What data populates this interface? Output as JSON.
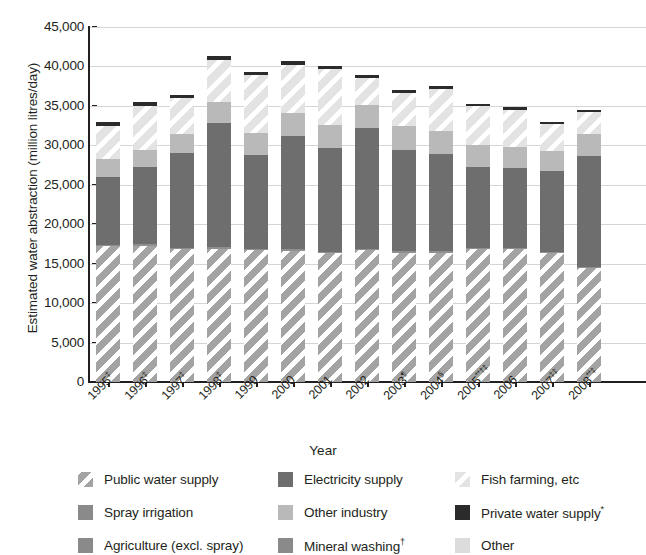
{
  "chart": {
    "type": "bar",
    "ylabel": "Estimated water abstraction (million litres/day)",
    "xlabel": "Year"
  },
  "y_axis": {
    "ticks": [
      "45,000",
      "40,000",
      "35,000",
      "30,000",
      "25,000",
      "20,000",
      "15,000",
      "10,000",
      "5,000",
      "0"
    ]
  },
  "x_axis": {
    "labels": [
      {
        "year": "1995",
        "note": "‡"
      },
      {
        "year": "1996",
        "note": "‡"
      },
      {
        "year": "1997",
        "note": "‡"
      },
      {
        "year": "1998",
        "note": "‡"
      },
      {
        "year": "1999",
        "note": ""
      },
      {
        "year": "2000",
        "note": ""
      },
      {
        "year": "2001",
        "note": ""
      },
      {
        "year": "2002",
        "note": ""
      },
      {
        "year": "2003",
        "note": "¶"
      },
      {
        "year": "2004",
        "note": "§"
      },
      {
        "year": "2005",
        "note": "**†‡"
      },
      {
        "year": "2006",
        "note": ""
      },
      {
        "year": "2007",
        "note": "‡‡"
      },
      {
        "year": "2008",
        "note": "**‡"
      }
    ]
  },
  "legend": {
    "items": [
      {
        "label": "Public water supply",
        "key": "public",
        "swatch": "hatch-medium"
      },
      {
        "label": "Spray irrigation",
        "key": "spray",
        "swatch": "solid-medium"
      },
      {
        "label": "Agriculture (excl. spray)",
        "key": "agri",
        "swatch": "solid-medium"
      },
      {
        "label": "Electricity supply",
        "key": "elec",
        "swatch": "solid-dark"
      },
      {
        "label": "Other industry",
        "key": "otherind",
        "swatch": "solid-light"
      },
      {
        "label": "Mineral washing",
        "note": "†",
        "key": "mineral",
        "swatch": "solid-medium"
      },
      {
        "label": "Fish farming, etc",
        "key": "fish",
        "swatch": "hatch-light"
      },
      {
        "label": "Private water supply",
        "note": "*",
        "key": "private",
        "swatch": "solid-black"
      },
      {
        "label": "Other",
        "key": "other",
        "swatch": "solid-verylight"
      }
    ]
  },
  "chart_data": {
    "type": "bar",
    "subtype": "stacked-vertical",
    "title": "",
    "xlabel": "Year",
    "ylabel": "Estimated water abstraction (million litres/day)",
    "ylim": [
      0,
      45000
    ],
    "ytick_step": 5000,
    "grid": true,
    "legend_position": "bottom",
    "categories": [
      "1995",
      "1996",
      "1997",
      "1998",
      "1999",
      "2000",
      "2001",
      "2002",
      "2003",
      "2004",
      "2005",
      "2006",
      "2007",
      "2008"
    ],
    "series": [
      {
        "name": "Public water supply",
        "values": [
          17200,
          17300,
          16800,
          16900,
          16700,
          16600,
          16300,
          16700,
          16400,
          16400,
          16800,
          16800,
          16300,
          14400
        ]
      },
      {
        "name": "Spray irrigation",
        "values": [
          200,
          200,
          200,
          200,
          200,
          200,
          200,
          200,
          200,
          200,
          200,
          200,
          200,
          200
        ]
      },
      {
        "name": "Electricity supply",
        "values": [
          8600,
          9700,
          12000,
          15700,
          11900,
          14400,
          13100,
          15300,
          12800,
          12300,
          10300,
          10100,
          10200,
          14100
        ]
      },
      {
        "name": "Other industry",
        "values": [
          2300,
          2200,
          2500,
          2700,
          2800,
          2900,
          3000,
          2900,
          3000,
          2900,
          2800,
          2700,
          2600,
          2700
        ]
      },
      {
        "name": "Fish farming, etc",
        "values": [
          4100,
          5600,
          4500,
          5300,
          7300,
          6100,
          7100,
          3400,
          4200,
          5300,
          4900,
          4700,
          3400,
          2800
        ]
      },
      {
        "name": "Private water supply",
        "values": [
          500,
          500,
          400,
          500,
          400,
          500,
          400,
          400,
          400,
          400,
          300,
          300,
          300,
          300
        ]
      }
    ],
    "totals": [
      32900,
      35500,
      36400,
      41300,
      39300,
      40700,
      40100,
      38900,
      37000,
      37500,
      35300,
      34800,
      33000,
      34500
    ]
  }
}
